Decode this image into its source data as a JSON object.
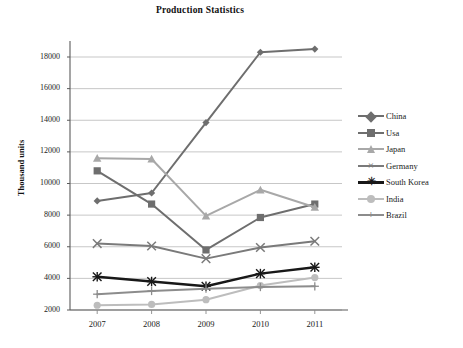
{
  "chart_data": {
    "type": "line",
    "title": "Production Statistics",
    "xlabel": "",
    "ylabel": "Thousand units",
    "x": [
      "2007",
      "2008",
      "2009",
      "2010",
      "2011"
    ],
    "categories": [
      "2007",
      "2008",
      "2009",
      "2010",
      "2011"
    ],
    "ylim": [
      2000,
      18000
    ],
    "ytick_values": [
      2000,
      4000,
      6000,
      8000,
      10000,
      12000,
      14000,
      16000,
      18000
    ],
    "ytick_labels": [
      "2000",
      "4000",
      "6000",
      "8000",
      "10000",
      "12000",
      "14000",
      "16000",
      "18000"
    ],
    "grid": true,
    "legend_position": "right",
    "series": [
      {
        "name": "China",
        "values": [
          8900,
          9400,
          13850,
          18300,
          18500
        ],
        "color": "#6e6e6e",
        "marker": "diamond"
      },
      {
        "name": "Usa",
        "values": [
          10800,
          8700,
          5800,
          7850,
          8700
        ],
        "color": "#6e6e6e",
        "marker": "square"
      },
      {
        "name": "Japan",
        "values": [
          11600,
          11550,
          7950,
          9600,
          8500
        ],
        "color": "#a8a8a8",
        "marker": "triangle"
      },
      {
        "name": "Germany",
        "values": [
          6200,
          6050,
          5250,
          5950,
          6350
        ],
        "color": "#7a7a7a",
        "marker": "x"
      },
      {
        "name": "South Korea",
        "values": [
          4100,
          3800,
          3500,
          4300,
          4700
        ],
        "color": "#181818",
        "marker": "asterisk"
      },
      {
        "name": "India",
        "values": [
          2300,
          2350,
          2650,
          3550,
          4050
        ],
        "color": "#bdbdbd",
        "marker": "circle"
      },
      {
        "name": "Brazil",
        "values": [
          3000,
          3200,
          3350,
          3450,
          3500
        ],
        "color": "#8c8c8c",
        "marker": "plus"
      }
    ]
  },
  "legend": {
    "items": [
      {
        "label": "China"
      },
      {
        "label": "Usa"
      },
      {
        "label": "Japan"
      },
      {
        "label": "Germany"
      },
      {
        "label": "South Korea"
      },
      {
        "label": "India"
      },
      {
        "label": "Brazil"
      }
    ]
  }
}
